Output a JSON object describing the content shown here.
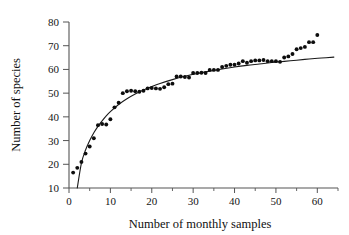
{
  "chart_data": {
    "type": "scatter",
    "title": "",
    "xlabel": "Number of monthly samples",
    "ylabel": "Number of species",
    "xlim": [
      0,
      65
    ],
    "ylim": [
      10,
      80
    ],
    "xticks": [
      0,
      10,
      20,
      30,
      40,
      50,
      60
    ],
    "xtick_labels": [
      "0",
      "10",
      "20",
      "30",
      "40",
      "50",
      "60"
    ],
    "xminor_ticks": [
      5,
      15,
      25,
      35,
      45,
      55,
      65
    ],
    "yticks": [
      10,
      20,
      30,
      40,
      50,
      60,
      70,
      80
    ],
    "ytick_labels": [
      "10",
      "20",
      "30",
      "40",
      "50",
      "60",
      "70",
      "80"
    ],
    "grid": false,
    "legend": null,
    "marker": "filled-circle",
    "marker_color": "#0d0d0d",
    "curve_color": "#1a1a1a",
    "x": [
      1,
      2,
      3,
      4,
      5,
      6,
      7,
      8,
      9,
      10,
      11,
      12,
      13,
      14,
      15,
      16,
      17,
      18,
      19,
      20,
      21,
      22,
      23,
      24,
      25,
      26,
      27,
      28,
      29,
      30,
      31,
      32,
      33,
      34,
      35,
      36,
      37,
      38,
      39,
      40,
      41,
      42,
      43,
      44,
      45,
      46,
      47,
      48,
      49,
      50,
      51,
      52,
      53,
      54,
      55,
      56,
      57,
      58,
      59,
      60
    ],
    "y": [
      16.5,
      18.5,
      21.0,
      24.5,
      27.5,
      31.0,
      36.5,
      37.0,
      36.8,
      39.0,
      44.0,
      46.0,
      50.0,
      50.8,
      51.0,
      50.8,
      50.6,
      51.0,
      52.0,
      52.2,
      52.0,
      51.8,
      52.5,
      53.8,
      54.0,
      57.0,
      57.0,
      56.8,
      56.6,
      58.5,
      58.5,
      58.6,
      58.5,
      59.8,
      59.8,
      59.8,
      61.0,
      61.5,
      62.0,
      62.0,
      62.5,
      63.5,
      62.8,
      63.5,
      63.8,
      63.8,
      64.0,
      63.5,
      63.5,
      63.5,
      63.2,
      65.0,
      65.5,
      66.5,
      68.5,
      69.0,
      69.5,
      71.5,
      71.5,
      74.5
    ],
    "fit_curve": {
      "label": "",
      "type": "logarithmic-fit",
      "x": [
        2.0,
        3,
        4,
        5,
        6,
        7,
        8,
        9,
        10,
        12,
        14,
        16,
        18,
        20,
        22,
        25,
        28,
        31,
        34,
        37,
        40,
        43,
        46,
        49,
        52,
        55,
        58,
        61,
        64
      ],
      "y": [
        10.0,
        20.5,
        26.0,
        30.0,
        33.3,
        36.0,
        38.3,
        40.4,
        42.2,
        45.2,
        47.6,
        49.6,
        51.3,
        52.8,
        54.1,
        55.7,
        57.1,
        58.3,
        59.3,
        60.2,
        61.0,
        61.7,
        62.3,
        62.9,
        63.4,
        63.9,
        64.4,
        64.8,
        65.2
      ]
    }
  },
  "axes": {
    "y_title": "Number of species",
    "x_title": "Number of monthly samples"
  }
}
